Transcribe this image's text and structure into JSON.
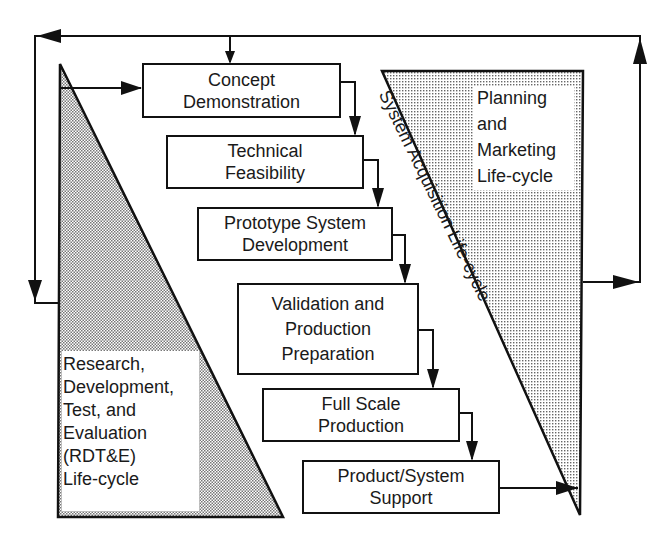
{
  "diagram": {
    "type": "lifecycle-flow",
    "stages": [
      {
        "id": "concept",
        "lines": [
          "Concept",
          "Demonstration"
        ]
      },
      {
        "id": "technical",
        "lines": [
          "Technical",
          "Feasibility"
        ]
      },
      {
        "id": "prototype",
        "lines": [
          "Prototype System",
          "Development"
        ]
      },
      {
        "id": "validation",
        "lines": [
          "Validation and",
          "Production",
          "Preparation"
        ]
      },
      {
        "id": "fullscale",
        "lines": [
          "Full Scale",
          "Production"
        ]
      },
      {
        "id": "support",
        "lines": [
          "Product/System",
          "Support"
        ]
      }
    ],
    "left_triangle": {
      "lines": [
        "Research,",
        "Development,",
        "Test, and",
        "Evaluation",
        "(RDT&E)",
        "Life-cycle"
      ]
    },
    "right_triangle": {
      "lines": [
        "Planning",
        "and",
        "Marketing",
        "Life-cycle"
      ]
    },
    "diagonal_label": "System Acquisition Life-cycle",
    "colors": {
      "stroke": "#111111",
      "shading": "#9a9a9a",
      "background": "#ffffff"
    }
  }
}
